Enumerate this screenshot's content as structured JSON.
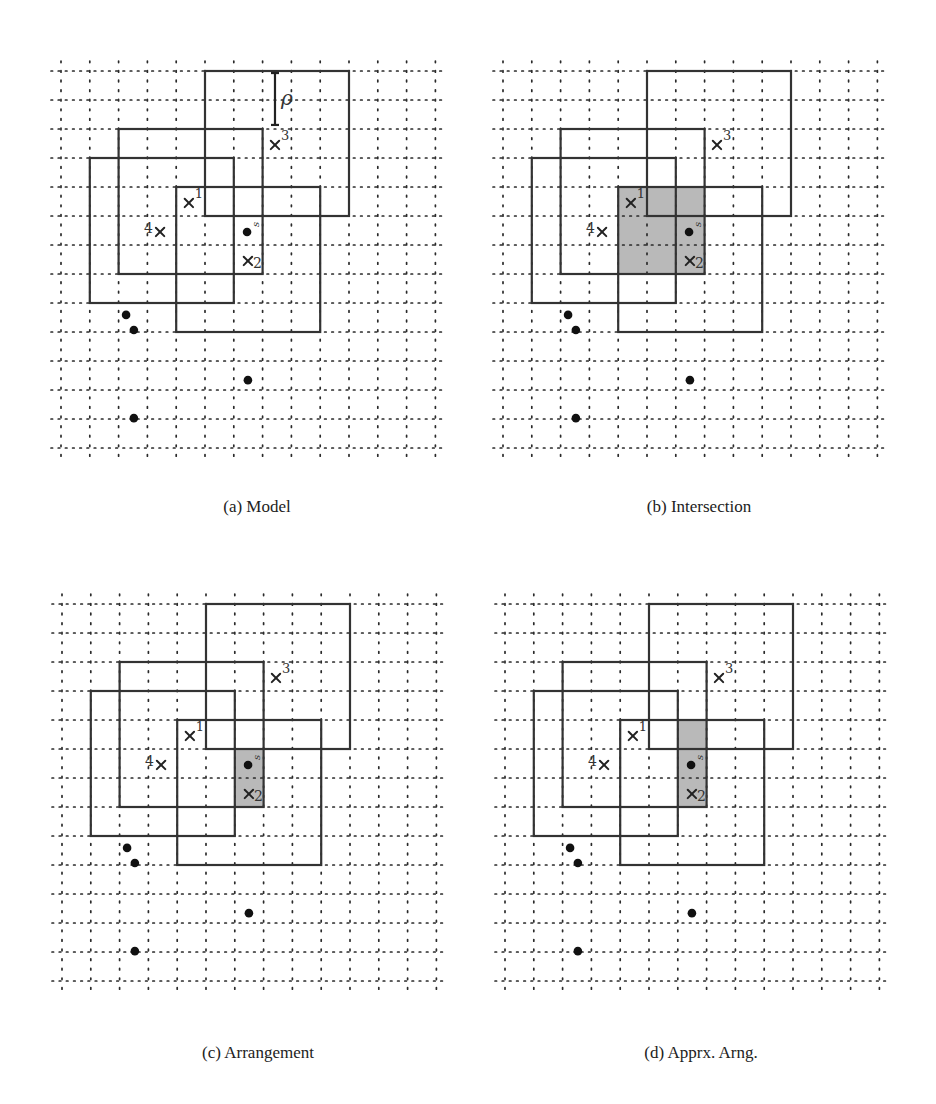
{
  "figure": {
    "grid": {
      "cols": 14,
      "rows": 14,
      "step_x": 28.8,
      "step_y": 29.0,
      "dot_overhang": 10
    },
    "rectangles": [
      {
        "id": "R3",
        "c0": 5,
        "r0": 0,
        "c1": 10,
        "r1": 5
      },
      {
        "id": "R2",
        "c0": 2,
        "r0": 2,
        "c1": 7,
        "r1": 7
      },
      {
        "id": "R4",
        "c0": 1,
        "r0": 3,
        "c1": 6,
        "r1": 8
      },
      {
        "id": "R1",
        "c0": 4,
        "r0": 4,
        "c1": 9,
        "r1": 9
      }
    ],
    "crosses": [
      {
        "label": "1",
        "c": 4.44,
        "r": 4.55,
        "label_pos": "sup-right"
      },
      {
        "label": "4",
        "c": 3.44,
        "r": 5.55,
        "label_pos": "left"
      },
      {
        "label": "2",
        "c": 6.49,
        "r": 6.55,
        "label_pos": "right"
      },
      {
        "label": "3",
        "c": 7.43,
        "r": 2.55,
        "label_pos": "sup-right"
      }
    ],
    "query_point": {
      "label": "s",
      "c": 6.46,
      "r": 5.55
    },
    "other_points": [
      {
        "c": 2.26,
        "r": 8.41
      },
      {
        "c": 2.53,
        "r": 8.93
      },
      {
        "c": 6.49,
        "r": 10.66
      },
      {
        "c": 2.53,
        "r": 11.97
      }
    ],
    "rho_marker": {
      "label": "ρ",
      "c": 7.43,
      "r0": 0.07,
      "r1": 1.86
    }
  },
  "panels": [
    {
      "id": "a",
      "caption": "(a) Model",
      "left": 61,
      "top": 71,
      "caption_top": 497,
      "shade": null,
      "show_rho": true
    },
    {
      "id": "b",
      "caption": "(b) Intersection",
      "left": 503,
      "top": 71,
      "caption_top": 497,
      "shade": {
        "c0": 4,
        "r0": 4,
        "c1": 7,
        "r1": 7
      },
      "show_rho": false
    },
    {
      "id": "c",
      "caption": "(c) Arrangement",
      "left": 62,
      "top": 604,
      "caption_top": 1043,
      "shade": {
        "c0": 6,
        "r0": 5,
        "c1": 7,
        "r1": 7
      },
      "show_rho": false
    },
    {
      "id": "d",
      "caption": "(d) Apprx. Arng.",
      "left": 505,
      "top": 604,
      "caption_top": 1043,
      "shade": {
        "c0": 6,
        "r0": 4,
        "c1": 7,
        "r1": 7
      },
      "show_rho": false
    }
  ],
  "colors": {
    "shade": "#b9b9b9",
    "lines": "#333333",
    "grid": "#2a2a2a",
    "points": "#111111"
  }
}
